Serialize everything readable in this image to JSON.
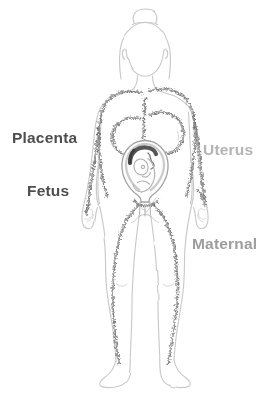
{
  "illustration": {
    "figure": "pregnant-female-body-front-outline-sketch"
  },
  "labels": {
    "placenta": "Placenta",
    "uterus": "Uterus",
    "fetus": "Fetus",
    "maternal": "Maternal"
  },
  "colors": {
    "label_dark": "#4e4e4e",
    "label_light": "#b4b4b4",
    "label_mid": "#9d9d9d",
    "body_outline": "#c9c9c9",
    "shading_scribble": "#8f8f8f",
    "uterus_wall": "#a3a3a3",
    "placenta_arc": "#565656",
    "background": "#ffffff"
  }
}
